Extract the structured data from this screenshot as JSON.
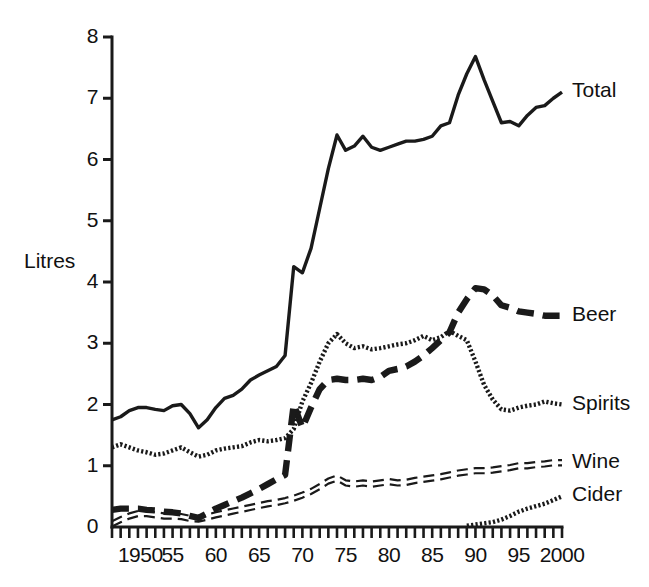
{
  "chart_data": {
    "type": "line",
    "title": "",
    "subtitle": "",
    "xlabel": "",
    "ylabel": "Litres",
    "xlim": [
      1948,
      2000
    ],
    "ylim": [
      0,
      8
    ],
    "grid": false,
    "legend_position": "right-of-plot-line-end",
    "y_ticks": [
      "0",
      "1",
      "2",
      "3",
      "4",
      "5",
      "6",
      "7",
      "8"
    ],
    "y_tick_values": [
      0,
      1,
      2,
      3,
      4,
      5,
      6,
      7,
      8
    ],
    "x_ticks": [
      "1950",
      "55",
      "60",
      "65",
      "70",
      "75",
      "80",
      "85",
      "90",
      "95",
      "2000"
    ],
    "x_tick_values": [
      1950,
      1955,
      1960,
      1965,
      1970,
      1975,
      1980,
      1985,
      1990,
      1995,
      2000
    ],
    "x_minor_tick_interval": 1,
    "annotations": [],
    "series": [
      {
        "name": "Total",
        "style": "solid",
        "color": "#1a1a1a",
        "label_year": 2000,
        "label_value": 7.1,
        "x": [
          1948,
          1949,
          1950,
          1951,
          1952,
          1953,
          1954,
          1955,
          1956,
          1957,
          1958,
          1959,
          1960,
          1961,
          1962,
          1963,
          1964,
          1965,
          1966,
          1967,
          1968,
          1969,
          1970,
          1971,
          1972,
          1973,
          1974,
          1975,
          1976,
          1977,
          1978,
          1979,
          1980,
          1981,
          1982,
          1983,
          1984,
          1985,
          1986,
          1987,
          1988,
          1989,
          1990,
          1991,
          1992,
          1993,
          1994,
          1995,
          1996,
          1997,
          1998,
          1999,
          2000
        ],
        "values": [
          1.75,
          1.8,
          1.9,
          1.95,
          1.95,
          1.92,
          1.9,
          1.98,
          2.0,
          1.85,
          1.62,
          1.75,
          1.95,
          2.1,
          2.15,
          2.25,
          2.4,
          2.48,
          2.55,
          2.62,
          2.8,
          4.25,
          4.15,
          4.55,
          5.2,
          5.85,
          6.4,
          6.15,
          6.22,
          6.38,
          6.2,
          6.15,
          6.2,
          6.25,
          6.3,
          6.3,
          6.33,
          6.38,
          6.55,
          6.6,
          7.05,
          7.4,
          7.68,
          7.3,
          6.95,
          6.6,
          6.62,
          6.55,
          6.72,
          6.85,
          6.88,
          7.0,
          7.1
        ]
      },
      {
        "name": "Beer",
        "style": "long-dash-thick",
        "color": "#1a1a1a",
        "label_year": 2000,
        "label_value": 3.45,
        "x": [
          1948,
          1949,
          1950,
          1951,
          1952,
          1953,
          1954,
          1955,
          1956,
          1957,
          1958,
          1959,
          1960,
          1961,
          1962,
          1963,
          1964,
          1965,
          1966,
          1967,
          1968,
          1969,
          1970,
          1971,
          1972,
          1973,
          1974,
          1975,
          1976,
          1977,
          1978,
          1979,
          1980,
          1981,
          1982,
          1983,
          1984,
          1985,
          1986,
          1987,
          1988,
          1989,
          1990,
          1991,
          1992,
          1993,
          1994,
          1995,
          1996,
          1997,
          1998,
          1999,
          2000
        ],
        "values": [
          0.28,
          0.3,
          0.3,
          0.3,
          0.28,
          0.27,
          0.25,
          0.24,
          0.22,
          0.18,
          0.15,
          0.22,
          0.3,
          0.36,
          0.42,
          0.48,
          0.55,
          0.62,
          0.7,
          0.78,
          0.85,
          2.0,
          1.62,
          1.95,
          2.25,
          2.4,
          2.42,
          2.4,
          2.4,
          2.42,
          2.4,
          2.45,
          2.55,
          2.58,
          2.62,
          2.7,
          2.8,
          2.92,
          3.05,
          3.18,
          3.5,
          3.72,
          3.9,
          3.88,
          3.78,
          3.62,
          3.58,
          3.52,
          3.5,
          3.48,
          3.45,
          3.45,
          3.45
        ]
      },
      {
        "name": "Spirits",
        "style": "fine-dot",
        "color": "#1a1a1a",
        "label_year": 2000,
        "label_value": 2.0,
        "x": [
          1948,
          1949,
          1950,
          1951,
          1952,
          1953,
          1954,
          1955,
          1956,
          1957,
          1958,
          1959,
          1960,
          1961,
          1962,
          1963,
          1964,
          1965,
          1966,
          1967,
          1968,
          1969,
          1970,
          1971,
          1972,
          1973,
          1974,
          1975,
          1976,
          1977,
          1978,
          1979,
          1980,
          1981,
          1982,
          1983,
          1984,
          1985,
          1986,
          1987,
          1988,
          1989,
          1990,
          1991,
          1992,
          1993,
          1994,
          1995,
          1996,
          1997,
          1998,
          1999,
          2000
        ],
        "values": [
          1.3,
          1.35,
          1.3,
          1.25,
          1.22,
          1.18,
          1.2,
          1.25,
          1.3,
          1.22,
          1.15,
          1.18,
          1.25,
          1.28,
          1.3,
          1.32,
          1.38,
          1.42,
          1.4,
          1.42,
          1.45,
          1.6,
          2.05,
          2.35,
          2.7,
          3.0,
          3.15,
          3.0,
          2.92,
          2.95,
          2.9,
          2.92,
          2.95,
          2.98,
          3.0,
          3.05,
          3.12,
          3.05,
          3.1,
          3.2,
          3.12,
          3.05,
          2.7,
          2.32,
          2.08,
          1.92,
          1.9,
          1.95,
          1.98,
          2.0,
          2.05,
          2.02,
          2.0
        ]
      },
      {
        "name": "Wine",
        "style": "double-dash",
        "color": "#1a1a1a",
        "label_year": 2000,
        "label_value": 1.05,
        "x": [
          1948,
          1949,
          1950,
          1951,
          1952,
          1953,
          1954,
          1955,
          1956,
          1957,
          1958,
          1959,
          1960,
          1961,
          1962,
          1963,
          1964,
          1965,
          1966,
          1967,
          1968,
          1969,
          1970,
          1971,
          1972,
          1973,
          1974,
          1975,
          1976,
          1977,
          1978,
          1979,
          1980,
          1981,
          1982,
          1983,
          1984,
          1985,
          1986,
          1987,
          1988,
          1989,
          1990,
          1991,
          1992,
          1993,
          1994,
          1995,
          1996,
          1997,
          1998,
          1999,
          2000
        ],
        "values": [
          0.05,
          0.12,
          0.18,
          0.22,
          0.22,
          0.2,
          0.18,
          0.18,
          0.17,
          0.14,
          0.13,
          0.16,
          0.2,
          0.23,
          0.26,
          0.29,
          0.32,
          0.35,
          0.38,
          0.4,
          0.43,
          0.47,
          0.52,
          0.58,
          0.66,
          0.75,
          0.8,
          0.72,
          0.7,
          0.72,
          0.7,
          0.72,
          0.74,
          0.72,
          0.73,
          0.76,
          0.78,
          0.8,
          0.82,
          0.85,
          0.88,
          0.9,
          0.92,
          0.92,
          0.93,
          0.95,
          0.97,
          1.0,
          1.0,
          1.02,
          1.03,
          1.05,
          1.05
        ]
      },
      {
        "name": "Cider",
        "style": "fine-dot",
        "color": "#1a1a1a",
        "label_year": 2000,
        "label_value": 0.5,
        "x": [
          1989,
          1990,
          1991,
          1992,
          1993,
          1994,
          1995,
          1996,
          1997,
          1998,
          1999,
          2000
        ],
        "values": [
          0.02,
          0.04,
          0.06,
          0.08,
          0.12,
          0.18,
          0.25,
          0.3,
          0.34,
          0.38,
          0.44,
          0.5
        ]
      }
    ]
  },
  "axis": {
    "y_title": "Litres"
  }
}
